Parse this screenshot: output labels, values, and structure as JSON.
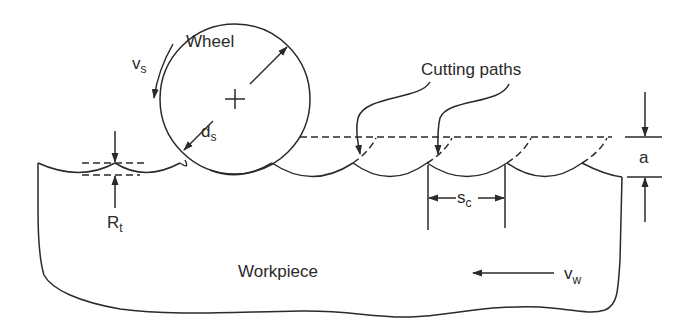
{
  "diagram": {
    "type": "grinding-process-schematic",
    "labels": {
      "wheel": "Wheel",
      "wheel_speed": "v",
      "wheel_speed_sub": "s",
      "wheel_diameter": "d",
      "wheel_diameter_sub": "s",
      "cutting_paths": "Cutting paths",
      "depth_of_cut": "a",
      "roughness": "R",
      "roughness_sub": "t",
      "cutting_spacing": "s",
      "cutting_spacing_sub": "c",
      "workpiece": "Workpiece",
      "workpiece_speed": "v",
      "workpiece_speed_sub": "w"
    },
    "colors": {
      "line": "#2a2a2a",
      "background": "#ffffff"
    }
  }
}
